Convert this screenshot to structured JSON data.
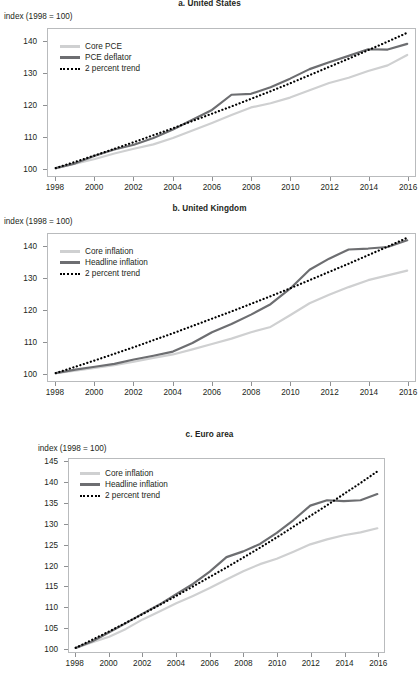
{
  "figure": {
    "y_axis_note": "index (1998 = 100)",
    "legend_labels": {
      "core_pce": "Core PCE",
      "pce_deflator": "PCE deflator",
      "core_inflation": "Core inflation",
      "headline_inflation": "Headline inflation",
      "trend": "2 percent trend"
    },
    "colors": {
      "core": "#cfd0d1",
      "headline": "#6d6e71",
      "trend": "#000000",
      "axis": "#b9bbbd",
      "text": "#231f20"
    }
  },
  "chart_data": [
    {
      "type": "line",
      "id": "panel-a",
      "title": "a. United States",
      "xlabel": "",
      "ylabel": "index (1998 = 100)",
      "x": [
        1998,
        1999,
        2000,
        2001,
        2002,
        2003,
        2004,
        2005,
        2006,
        2007,
        2008,
        2009,
        2010,
        2011,
        2012,
        2013,
        2014,
        2015,
        2016
      ],
      "xlim": [
        1997.6,
        2016.4
      ],
      "ylim": [
        97.5,
        144
      ],
      "xticks": [
        1998,
        2000,
        2002,
        2004,
        2006,
        2008,
        2010,
        2012,
        2014,
        2016
      ],
      "yticks": [
        100,
        110,
        120,
        130,
        140
      ],
      "xtick_labels": [
        "1998",
        "2000",
        "2002",
        "2004",
        "2006",
        "2008",
        "2010",
        "2012",
        "2014",
        "2016"
      ],
      "ytick_labels": [
        "100",
        "110",
        "120",
        "130",
        "140"
      ],
      "grid": false,
      "legend_position": "top-left",
      "series": [
        {
          "name": "Core PCE",
          "style": "solid",
          "color": "#cfd0d1",
          "values": [
            100.0,
            101.4,
            102.9,
            104.6,
            106.1,
            107.5,
            109.5,
            111.9,
            114.3,
            116.8,
            119.2,
            120.5,
            122.3,
            124.6,
            126.9,
            128.6,
            130.7,
            132.5,
            135.8
          ]
        },
        {
          "name": "PCE deflator",
          "style": "solid",
          "color": "#6d6e71",
          "values": [
            100.0,
            101.5,
            103.9,
            105.9,
            107.4,
            109.5,
            112.2,
            115.3,
            118.4,
            123.2,
            123.5,
            125.6,
            128.3,
            131.3,
            133.5,
            135.5,
            137.6,
            137.5,
            139.3
          ]
        },
        {
          "name": "2 percent trend",
          "style": "dotted",
          "color": "#000000",
          "values": [
            100.0,
            102.0,
            104.0,
            106.1,
            108.2,
            110.4,
            112.6,
            114.9,
            117.2,
            119.5,
            121.9,
            124.3,
            126.8,
            129.4,
            132.0,
            134.6,
            137.3,
            140.0,
            142.8
          ]
        }
      ]
    },
    {
      "type": "line",
      "id": "panel-b",
      "title": "b. United Kingdom",
      "xlabel": "",
      "ylabel": "index (1998 = 100)",
      "x": [
        1998,
        1999,
        2000,
        2001,
        2002,
        2003,
        2004,
        2005,
        2006,
        2007,
        2008,
        2009,
        2010,
        2011,
        2012,
        2013,
        2014,
        2015,
        2016
      ],
      "xlim": [
        1997.6,
        2016.4
      ],
      "ylim": [
        97.5,
        144
      ],
      "xticks": [
        1998,
        2000,
        2002,
        2004,
        2006,
        2008,
        2010,
        2012,
        2014,
        2016
      ],
      "yticks": [
        100,
        110,
        120,
        130,
        140
      ],
      "xtick_labels": [
        "1998",
        "2000",
        "2002",
        "2004",
        "2006",
        "2008",
        "2010",
        "2012",
        "2014",
        "2016"
      ],
      "ytick_labels": [
        "100",
        "110",
        "120",
        "130",
        "140"
      ],
      "grid": false,
      "legend_position": "top-left",
      "series": [
        {
          "name": "Core inflation",
          "style": "solid",
          "color": "#cfd0d1",
          "values": [
            100.0,
            100.8,
            101.6,
            102.5,
            103.6,
            104.8,
            105.9,
            107.5,
            109.2,
            110.9,
            112.9,
            114.6,
            118.3,
            122.1,
            124.8,
            127.2,
            129.4,
            130.9,
            132.4
          ]
        },
        {
          "name": "Headline inflation",
          "style": "solid",
          "color": "#6d6e71",
          "values": [
            100.0,
            101.1,
            102.0,
            102.9,
            104.3,
            105.5,
            106.8,
            109.5,
            112.9,
            115.5,
            118.5,
            121.8,
            126.7,
            132.7,
            136.2,
            139.1,
            139.4,
            139.9,
            142.0
          ]
        },
        {
          "name": "2 percent trend",
          "style": "dotted",
          "color": "#000000",
          "values": [
            100.0,
            102.0,
            104.0,
            106.1,
            108.2,
            110.4,
            112.6,
            114.9,
            117.2,
            119.5,
            121.9,
            124.3,
            126.8,
            129.4,
            132.0,
            134.6,
            137.3,
            140.0,
            142.8
          ]
        }
      ]
    },
    {
      "type": "line",
      "id": "panel-c",
      "title": "c. Euro area",
      "xlabel": "",
      "ylabel": "index (1998 = 100)",
      "x": [
        1998,
        1999,
        2000,
        2001,
        2002,
        2003,
        2004,
        2005,
        2006,
        2007,
        2008,
        2009,
        2010,
        2011,
        2012,
        2013,
        2014,
        2015,
        2016
      ],
      "xlim": [
        1997.6,
        2016.4
      ],
      "ylim": [
        99.0,
        145.8
      ],
      "xticks": [
        1998,
        2000,
        2002,
        2004,
        2006,
        2008,
        2010,
        2012,
        2014,
        2016
      ],
      "yticks": [
        100,
        105,
        110,
        115,
        120,
        125,
        130,
        135,
        140,
        145
      ],
      "xtick_labels": [
        "1998",
        "2000",
        "2002",
        "2004",
        "2006",
        "2008",
        "2010",
        "2012",
        "2014",
        "2016"
      ],
      "ytick_labels": [
        "100",
        "105",
        "110",
        "115",
        "120",
        "125",
        "130",
        "135",
        "140",
        "145"
      ],
      "grid": false,
      "legend_position": "top-left",
      "series": [
        {
          "name": "Core inflation",
          "style": "solid",
          "color": "#cfd0d1",
          "values": [
            100.0,
            101.4,
            102.7,
            104.6,
            106.9,
            108.8,
            110.8,
            112.6,
            114.5,
            116.6,
            118.6,
            120.3,
            121.6,
            123.3,
            125.1,
            126.3,
            127.3,
            128.0,
            129.0
          ]
        },
        {
          "name": "Headline inflation",
          "style": "solid",
          "color": "#6d6e71",
          "values": [
            100.0,
            101.6,
            103.8,
            106.0,
            108.3,
            110.5,
            113.0,
            115.5,
            118.5,
            122.0,
            123.4,
            125.2,
            127.9,
            131.0,
            134.5,
            135.8,
            135.6,
            135.8,
            137.3
          ]
        },
        {
          "name": "2 percent trend",
          "style": "dotted",
          "color": "#000000",
          "values": [
            100.0,
            102.0,
            104.0,
            106.1,
            108.2,
            110.4,
            112.6,
            114.9,
            117.2,
            119.5,
            121.9,
            124.3,
            126.8,
            129.4,
            132.0,
            134.6,
            137.3,
            140.0,
            142.8
          ]
        }
      ]
    }
  ]
}
